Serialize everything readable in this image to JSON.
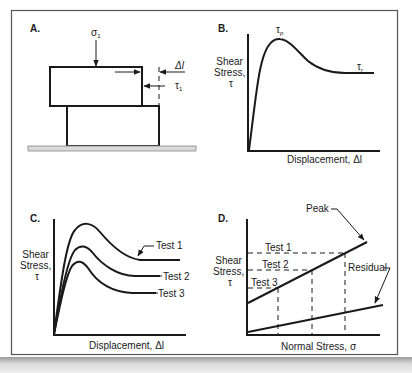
{
  "panels": {
    "a": {
      "letter": "A.",
      "normal_stress_label": "σ",
      "normal_stress_sub": "1",
      "shear_stress_label": "τ",
      "shear_stress_sub": "1",
      "displacement_label": "Δl"
    },
    "b": {
      "letter": "B.",
      "ylabel_line1": "Shear",
      "ylabel_line2": "Stress,",
      "ylabel_line3": "τ",
      "xlabel": "Displacement, Δl",
      "peak_label": "τ",
      "peak_sub": "p",
      "residual_label": "τ",
      "residual_sub": "r"
    },
    "c": {
      "letter": "C.",
      "ylabel_line1": "Shear",
      "ylabel_line2": "Stress,",
      "ylabel_line3": "τ",
      "xlabel": "Displacement, Δl",
      "series": [
        "Test 1",
        "Test 2",
        "Test 3"
      ]
    },
    "d": {
      "letter": "D.",
      "ylabel_line1": "Shear",
      "ylabel_line2": "Stress,",
      "ylabel_line3": "τ",
      "xlabel": "Normal Stress, σ",
      "tests": [
        "Test 1",
        "Test 2",
        "Test 3"
      ],
      "peak_label": "Peak",
      "residual_label": "Residual"
    }
  },
  "colors": {
    "ink": "#1a1a1a",
    "frame": "#555555",
    "base_fill": "#d9d9d9"
  }
}
